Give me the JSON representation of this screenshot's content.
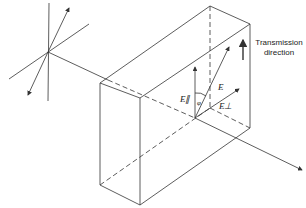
{
  "diagram": {
    "labels": {
      "transmission_line1": "Transmission",
      "transmission_line2": "direction",
      "e_vector": "E",
      "e_parallel": "E∥",
      "e_perp": "E⊥",
      "angle": "φ"
    },
    "colors": {
      "line": "#333333",
      "background": "#ffffff"
    }
  }
}
